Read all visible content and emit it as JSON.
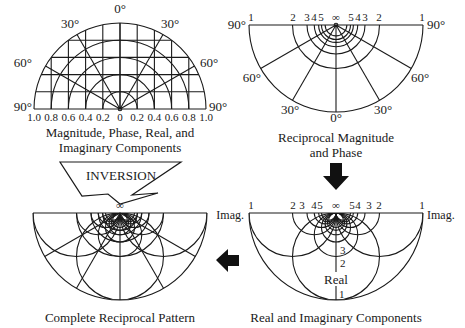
{
  "panels": {
    "top_left": {
      "caption_line1": "Magnitude, Phase, Real, and",
      "caption_line2": "Imaginary Components",
      "angle_labels": [
        "0°",
        "30°",
        "30°",
        "60°",
        "60°",
        "90°",
        "90°"
      ],
      "axis_ticks": [
        "1.0",
        "0.8",
        "0.6",
        "0.4",
        "0.2",
        "0",
        "0.2",
        "0.4",
        "0.6",
        "0.8",
        "1.0"
      ]
    },
    "top_right": {
      "caption_line1": "Reciprocal Magnitude",
      "caption_line2": "and Phase",
      "angle_labels": [
        "90°",
        "90°",
        "60°",
        "60°",
        "30°",
        "30°",
        "0°"
      ],
      "top_ticks_left": [
        "1",
        "2",
        "3",
        "4",
        "5"
      ],
      "infinity": "∞",
      "top_ticks_right": [
        "5",
        "4",
        "3",
        "2",
        "1"
      ]
    },
    "bottom_left": {
      "caption": "Complete Reciprocal Pattern",
      "infinity": "∞"
    },
    "bottom_right": {
      "caption": "Real and Imaginary Components",
      "imag_label_left": "Imag.",
      "imag_label_right": "Imag.",
      "real_label": "Real",
      "top_ticks_left": [
        "1",
        "2",
        "3",
        "4",
        "5"
      ],
      "infinity": "∞",
      "top_ticks_right": [
        "5",
        "4",
        "3",
        "2",
        "1"
      ],
      "real_ticks": [
        "3",
        "2",
        "1"
      ]
    }
  },
  "arrows": {
    "inversion_label": "INVERSION",
    "down_arrow": "black-down-arrow",
    "left_arrow": "black-left-arrow"
  }
}
